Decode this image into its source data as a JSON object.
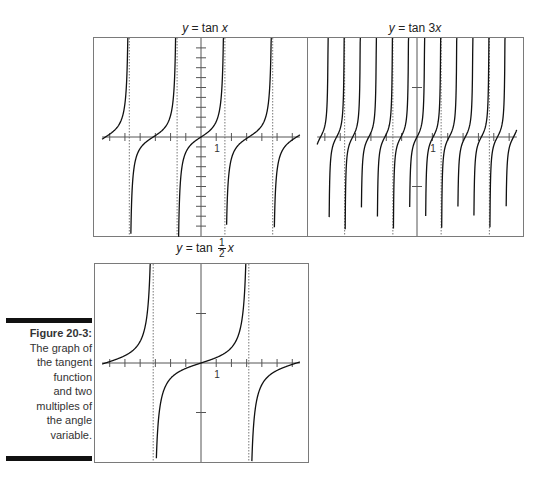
{
  "figure": {
    "label": "Figure 20-3:",
    "caption_lines": [
      "The graph of",
      "the tangent",
      "function",
      "and two",
      "multiples of",
      "the angle",
      "variable."
    ]
  },
  "charts": {
    "tanx": {
      "title_prefix": "y",
      "title_eq": " = tan ",
      "title_var": "x",
      "tick_label": "1"
    },
    "tan3x": {
      "title_prefix": "y",
      "title_eq": " = tan 3",
      "title_var": "x",
      "tick_label": "1"
    },
    "tanhalf": {
      "title_prefix": "y",
      "title_eq": " = tan ",
      "frac_num": "1",
      "frac_den": "2",
      "title_var": "x",
      "tick_label": "1"
    }
  },
  "chart_data": [
    {
      "type": "line",
      "title": "y = tan x",
      "function": "tan(x)",
      "xlim": [
        -7,
        7
      ],
      "ylim": [
        -10,
        10
      ],
      "x_tick_step": 1,
      "y_tick_step": 1,
      "asymptotes": [
        -4.712,
        -1.571,
        1.571,
        4.712
      ],
      "tick_label": "1",
      "grid": false
    },
    {
      "type": "line",
      "title": "y = tan 3x",
      "function": "tan(3x)",
      "xlim": [
        -7,
        7
      ],
      "ylim": [
        -10,
        10
      ],
      "x_tick_step": 1,
      "y_tick_step": 5,
      "asymptotes": [
        -4.712,
        -1.571,
        1.571,
        4.712
      ],
      "tick_label": "1",
      "grid": false
    },
    {
      "type": "line",
      "title": "y = tan (1/2) x",
      "function": "tan(x/2)",
      "xlim": [
        -7,
        7
      ],
      "ylim": [
        -10,
        10
      ],
      "x_tick_step": 1,
      "y_tick_step": 5,
      "asymptotes": [
        -3.1416,
        3.1416
      ],
      "tick_label": "1",
      "grid": false
    }
  ]
}
